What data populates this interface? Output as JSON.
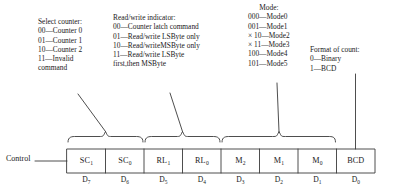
{
  "diagram": {
    "title_text": "8254/8253 Control Word Format",
    "control_label": "Control",
    "line_color": "#3a3a3a",
    "text_color": "#1a1a1a",
    "background": "#ffffff"
  },
  "annotations": {
    "select_counter": {
      "heading": "Select counter:",
      "lines": [
        "00—Counter 0",
        "01—Counter 1",
        "10—Counter 2",
        "11—Invalid",
        "command"
      ]
    },
    "read_write": {
      "heading": "Read/write indicator:",
      "lines": [
        "00—Counter latch command",
        "01—Read/write LSByte only",
        "10—Read/writeMSByte only",
        "11—Read/write LSByte",
        "first,then MSByte"
      ]
    },
    "mode": {
      "heading": "Mode:",
      "lines": [
        "000—Mode0",
        "001—Mode1",
        "× 10—Mode2",
        "× 11—Mode3",
        "100—Mode4",
        "101—Mode5"
      ]
    },
    "format_of_count": {
      "heading": "Format of count:",
      "lines": [
        "0—Binary",
        "1—BCD"
      ]
    }
  },
  "control_word": {
    "cells": [
      {
        "base": "SC",
        "sub": "1",
        "bit": "D",
        "bit_sub": "7"
      },
      {
        "base": "SC",
        "sub": "0",
        "bit": "D",
        "bit_sub": "6"
      },
      {
        "base": "RL",
        "sub": "1",
        "bit": "D",
        "bit_sub": "5"
      },
      {
        "base": "RL",
        "sub": "0",
        "bit": "D",
        "bit_sub": "4"
      },
      {
        "base": "M",
        "sub": "2",
        "bit": "D",
        "bit_sub": "3"
      },
      {
        "base": "M",
        "sub": "1",
        "bit": "D",
        "bit_sub": "2"
      },
      {
        "base": "M",
        "sub": "0",
        "bit": "D",
        "bit_sub": "1"
      },
      {
        "base": "BCD",
        "sub": "",
        "bit": "D",
        "bit_sub": "0"
      }
    ]
  }
}
